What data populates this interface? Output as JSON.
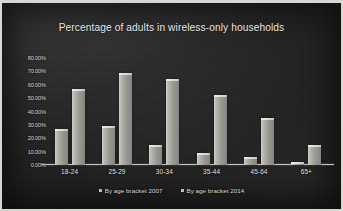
{
  "chart_data": {
    "type": "bar",
    "title": "Percentage of adults in wireless-only households",
    "xlabel": "",
    "ylabel": "",
    "categories": [
      "18-24",
      "25-29",
      "30-34",
      "35-44",
      "45-64",
      "65+"
    ],
    "series": [
      {
        "name": "By age bracket 2007",
        "values": [
          27,
          29,
          15,
          9,
          6,
          2
        ]
      },
      {
        "name": "By age bracket 2014",
        "values": [
          57,
          69,
          64,
          52,
          35,
          15
        ]
      }
    ],
    "ylim": [
      0,
      80
    ],
    "yticks": [
      0,
      10,
      20,
      30,
      40,
      50,
      60,
      70,
      80
    ],
    "ytick_labels": [
      "0.00%",
      "10.00%",
      "20.00%",
      "30.00%",
      "40.00%",
      "50.00%",
      "60.00%",
      "70.00%",
      "80.00%"
    ],
    "grid": false,
    "legend_position": "bottom",
    "colors": {
      "background": "#1b1b1b",
      "frame": "#d8d6d2",
      "bar": "#b0b0aa",
      "text": "#e4e4e0",
      "axis": "#ececE8"
    }
  }
}
